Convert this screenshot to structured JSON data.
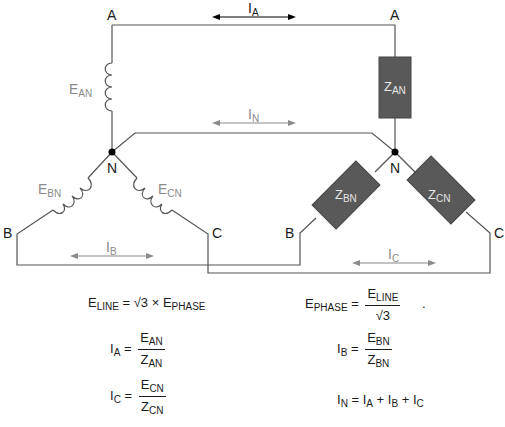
{
  "diagram": {
    "source": {
      "nodes": {
        "A": "A",
        "B": "B",
        "C": "C",
        "N": "N"
      },
      "windings": [
        {
          "main": "E",
          "sub": "AN"
        },
        {
          "main": "E",
          "sub": "BN"
        },
        {
          "main": "E",
          "sub": "CN"
        }
      ]
    },
    "load": {
      "nodes": {
        "A": "A",
        "B": "B",
        "C": "C",
        "N": "N"
      },
      "impedances": [
        {
          "main": "Z",
          "sub": "AN"
        },
        {
          "main": "Z",
          "sub": "BN"
        },
        {
          "main": "Z",
          "sub": "CN"
        }
      ]
    },
    "currents": {
      "IA": {
        "main": "I",
        "sub": "A"
      },
      "IN": {
        "main": "I",
        "sub": "N"
      },
      "IB": {
        "main": "I",
        "sub": "B"
      },
      "IC": {
        "main": "I",
        "sub": "C"
      }
    },
    "colors": {
      "wire": "#555555",
      "impedance_fill": "#595959",
      "winding_label": "#8a8a8a",
      "arrow_gray": "#8a8a8a",
      "arrow_black": "#000000"
    }
  },
  "equations": {
    "eline": {
      "lhs_main": "E",
      "lhs_sub": "LINE",
      "rhs": "= √3 × E",
      "rhs_sub": "PHASE"
    },
    "ephase": {
      "lhs_main": "E",
      "lhs_sub": "PHASE",
      "eq": "=",
      "num_main": "E",
      "num_sub": "LINE",
      "den": "√3",
      "trailing": "."
    },
    "ia": {
      "lhs_main": "I",
      "lhs_sub": "A",
      "eq": "=",
      "num_main": "E",
      "num_sub": "AN",
      "den_main": "Z",
      "den_sub": "AN"
    },
    "ib": {
      "lhs_main": "I",
      "lhs_sub": "B",
      "eq": "=",
      "num_main": "E",
      "num_sub": "BN",
      "den_main": "Z",
      "den_sub": "BN"
    },
    "ic": {
      "lhs_main": "I",
      "lhs_sub": "C",
      "eq": "=",
      "num_main": "E",
      "num_sub": "CN",
      "den_main": "Z",
      "den_sub": "CN"
    },
    "in": {
      "lhs_main": "I",
      "lhs_sub": "N",
      "t1": "= I",
      "s1": "A",
      "t2": " + I",
      "s2": "B",
      "t3": " + I",
      "s3": "C"
    }
  }
}
